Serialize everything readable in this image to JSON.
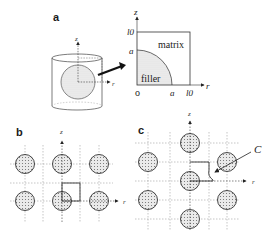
{
  "panels": {
    "a": {
      "label": "a",
      "cylinder_axes": {
        "z": "z",
        "r": "r"
      },
      "cross_section": {
        "z_axis": "z",
        "r_axis": "r",
        "tick_z_top": "l0",
        "tick_z_a": "a",
        "origin": "o",
        "tick_r_a": "a",
        "tick_r_top": "l0",
        "region_matrix": "matrix",
        "region_filler": "filler"
      }
    },
    "b": {
      "label": "b",
      "z_axis": "z",
      "r_axis": "r"
    },
    "c": {
      "label": "c",
      "z_axis": "z",
      "r_axis": "r",
      "callout": "C"
    }
  },
  "colors": {
    "line": "#333333",
    "filler": "#e6e6e6",
    "dots": "#777777",
    "grid": "#888888"
  }
}
